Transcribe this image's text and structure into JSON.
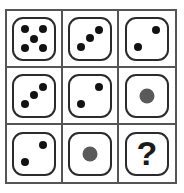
{
  "puzzle": {
    "title": "Dice Grid Puzzle",
    "type": "3x3-dice-matrix",
    "rows": 3,
    "columns": 3,
    "colors": {
      "frame_line": "#555555",
      "die_outline": "#2b2b2b",
      "die_face": "#ffffff",
      "small_pip": "#121212",
      "large_pip": "#5a5a5a",
      "question_mark": "#1a1a1a",
      "background": "#ffffff"
    },
    "cells": [
      {
        "index": 1,
        "row": 1,
        "column": 1,
        "kind": "die",
        "value": 5,
        "pip_style": "small",
        "pips": [
          {
            "x": 27,
            "y": 27
          },
          {
            "x": 73,
            "y": 27
          },
          {
            "x": 50,
            "y": 50
          },
          {
            "x": 27,
            "y": 73
          },
          {
            "x": 73,
            "y": 73
          }
        ]
      },
      {
        "index": 2,
        "row": 1,
        "column": 2,
        "kind": "die",
        "value": 3,
        "pip_style": "small",
        "pips": [
          {
            "x": 72,
            "y": 28
          },
          {
            "x": 50,
            "y": 48
          },
          {
            "x": 28,
            "y": 70
          }
        ]
      },
      {
        "index": 3,
        "row": 1,
        "column": 3,
        "kind": "die",
        "value": 2,
        "pip_style": "small",
        "pips": [
          {
            "x": 72,
            "y": 28
          },
          {
            "x": 28,
            "y": 70
          }
        ]
      },
      {
        "index": 4,
        "row": 2,
        "column": 1,
        "kind": "die",
        "value": 3,
        "pip_style": "small",
        "pips": [
          {
            "x": 72,
            "y": 28
          },
          {
            "x": 50,
            "y": 48
          },
          {
            "x": 28,
            "y": 70
          }
        ]
      },
      {
        "index": 5,
        "row": 2,
        "column": 2,
        "kind": "die",
        "value": 2,
        "pip_style": "small",
        "pips": [
          {
            "x": 72,
            "y": 28
          },
          {
            "x": 28,
            "y": 70
          }
        ]
      },
      {
        "index": 6,
        "row": 2,
        "column": 3,
        "kind": "die",
        "value": 1,
        "pip_style": "big",
        "pips": [
          {
            "x": 50,
            "y": 50
          }
        ]
      },
      {
        "index": 7,
        "row": 3,
        "column": 1,
        "kind": "die",
        "value": 2,
        "pip_style": "small",
        "pips": [
          {
            "x": 72,
            "y": 28
          },
          {
            "x": 28,
            "y": 70
          }
        ]
      },
      {
        "index": 8,
        "row": 3,
        "column": 2,
        "kind": "die",
        "value": 1,
        "pip_style": "big",
        "pips": [
          {
            "x": 50,
            "y": 50
          }
        ]
      },
      {
        "index": 9,
        "row": 3,
        "column": 3,
        "kind": "unknown",
        "value": null,
        "label": "?"
      }
    ]
  }
}
